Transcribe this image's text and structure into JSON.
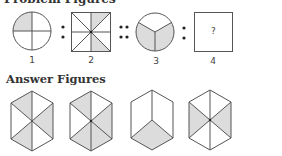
{
  "problem_section": {
    "title": "Problem Figures",
    "labels": [
      "1",
      "2",
      "3",
      "4"
    ],
    "question_mark": "?",
    "separators": [
      ":",
      "::",
      ":"
    ]
  },
  "answer_section": {
    "title": "Answer Figures"
  },
  "colors": {
    "stroke": "#555555",
    "shade": "#dcdcdc",
    "background": "#ffffff"
  }
}
